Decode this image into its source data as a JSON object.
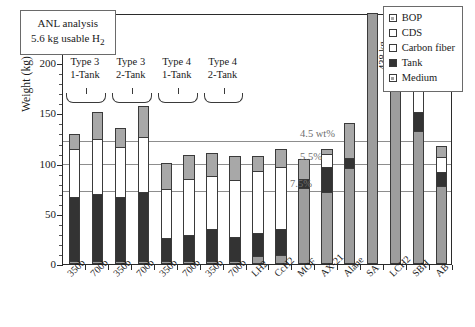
{
  "chart_data": {
    "type": "bar",
    "title": "",
    "xlabel": "",
    "ylabel": "Weight (kg)",
    "ylim": [
      0,
      250
    ],
    "yticks": [
      0,
      50,
      100,
      150,
      200,
      250
    ],
    "grid": "horizontal-annotated",
    "legend_position": "top-right",
    "stacked": true,
    "series_order": [
      "Medium",
      "Tank",
      "Carbon fiber",
      "CDS",
      "BOP"
    ],
    "categories": [
      "350b",
      "700b",
      "350b",
      "700b",
      "350b",
      "700b",
      "350b",
      "700b",
      "LH2",
      "CcH2",
      "MOF",
      "AX-21",
      "Alane",
      "SA",
      "LCH2",
      "SBH",
      "AB"
    ],
    "series": [
      {
        "name": "Medium",
        "values": [
          3,
          3,
          3,
          3,
          3,
          3,
          3,
          3,
          8,
          9,
          76,
          72,
          96,
          250,
          178,
          132,
          78
        ]
      },
      {
        "name": "Tank",
        "values": [
          65,
          68,
          65,
          70,
          24,
          27,
          33,
          25,
          24,
          27,
          10,
          26,
          10,
          0,
          14,
          20,
          15
        ]
      },
      {
        "name": "Carbon fiber",
        "values": [
          48,
          55,
          50,
          55,
          50,
          56,
          53,
          57,
          0,
          0,
          0,
          13,
          0,
          0,
          20,
          29,
          15
        ]
      },
      {
        "name": "CDS",
        "values": [
          0,
          0,
          0,
          0,
          0,
          0,
          0,
          0,
          62,
          62,
          0,
          0,
          0,
          0,
          0,
          0,
          0
        ]
      },
      {
        "name": "BOP",
        "values": [
          16,
          28,
          20,
          32,
          26,
          25,
          24,
          25,
          16,
          19,
          20,
          6,
          36,
          0,
          11,
          9,
          12
        ]
      }
    ],
    "totals": [
      132,
      154,
      138,
      160,
      103,
      111,
      113,
      110,
      110,
      117,
      106,
      117,
      142,
      438,
      223,
      190,
      120
    ],
    "gridlines": [
      {
        "label": "4.5 wt%",
        "value": 124.4
      },
      {
        "label": "5.5%",
        "value": 101.8
      },
      {
        "label": "7.5%",
        "value": 74.7
      }
    ],
    "annotations": [
      {
        "name": "sa-overflow",
        "text": "438 kg",
        "for": "SA"
      }
    ]
  },
  "note_box": {
    "line1": "ANL analysis",
    "line2_prefix": "5.6 kg usable H",
    "line2_sub": "2"
  },
  "groups": [
    {
      "line1": "Type 3",
      "line2": "1-Tank"
    },
    {
      "line1": "Type 3",
      "line2": "2-Tank"
    },
    {
      "line1": "Type 4",
      "line2": "1-Tank"
    },
    {
      "line1": "Type 4",
      "line2": "2-Tank"
    }
  ],
  "legend": {
    "items": [
      {
        "label": "BOP",
        "swatch": "#a8a8a8"
      },
      {
        "label": "CDS",
        "swatch": "#ffffff"
      },
      {
        "label": "Carbon fiber",
        "swatch": "#ffffff"
      },
      {
        "label": "Tank",
        "swatch": "#333333"
      },
      {
        "label": "Medium",
        "swatch": "#9d9d9d"
      }
    ]
  },
  "axis": {
    "y_title": "Weight (kg)"
  }
}
